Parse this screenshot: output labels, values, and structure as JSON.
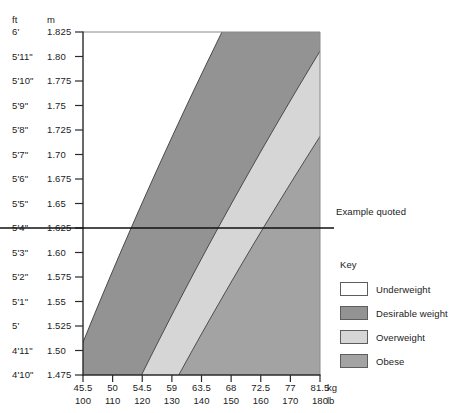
{
  "chart_data": {
    "type": "area",
    "title": "",
    "subtitle": "",
    "xlabel": "",
    "ylabel": "",
    "grid": false,
    "legend_position": "right",
    "y_axis": {
      "unit_primary": "ft",
      "unit_secondary": "m",
      "ticks": [
        {
          "ft": "6'",
          "m": "1.825"
        },
        {
          "ft": "5'11\"",
          "m": "1.80"
        },
        {
          "ft": "5'10\"",
          "m": "1.775"
        },
        {
          "ft": "5'9\"",
          "m": "1.75"
        },
        {
          "ft": "5'8\"",
          "m": "1.725"
        },
        {
          "ft": "5'7\"",
          "m": "1.70"
        },
        {
          "ft": "5'6\"",
          "m": "1.675"
        },
        {
          "ft": "5'5\"",
          "m": "1.65"
        },
        {
          "ft": "5'4\"",
          "m": "1.625"
        },
        {
          "ft": "5'3\"",
          "m": "1.60"
        },
        {
          "ft": "5'2\"",
          "m": "1.575"
        },
        {
          "ft": "5'1\"",
          "m": "1.55"
        },
        {
          "ft": "5'",
          "m": "1.525"
        },
        {
          "ft": "4'11\"",
          "m": "1.50"
        },
        {
          "ft": "4'10\"",
          "m": "1.475"
        }
      ],
      "range_m": [
        1.475,
        1.825
      ]
    },
    "x_axis": {
      "unit_primary": "kg",
      "unit_secondary": "lb",
      "ticks": [
        {
          "kg": "45.5",
          "lb": "100"
        },
        {
          "kg": "50",
          "lb": "110"
        },
        {
          "kg": "54.5",
          "lb": "120"
        },
        {
          "kg": "59",
          "lb": "130"
        },
        {
          "kg": "63.5",
          "lb": "140"
        },
        {
          "kg": "68",
          "lb": "150"
        },
        {
          "kg": "72.5",
          "lb": "160"
        },
        {
          "kg": "77",
          "lb": "170"
        },
        {
          "kg": "81.5",
          "lb": "180"
        }
      ],
      "range_kg": [
        41.0,
        86.0
      ],
      "range_lb": [
        90,
        190
      ]
    },
    "bands": [
      {
        "name": "Underweight",
        "color": "#ffffff",
        "bmi_range": "below 20"
      },
      {
        "name": "Desirable weight",
        "color": "#939393",
        "bmi_range": "20 to 25"
      },
      {
        "name": "Overweight",
        "color": "#d6d6d6",
        "bmi_range": "25 to 30"
      },
      {
        "name": "Obese",
        "color": "#a3a3a3",
        "bmi_range": "over 30"
      }
    ],
    "annotations": [
      {
        "label": "Example quoted",
        "type": "horizontal-line",
        "at_m": "1.625",
        "at_ft": "5'4\""
      }
    ]
  },
  "legend": {
    "title": "Key",
    "items": [
      {
        "label": "Underweight",
        "color": "#ffffff"
      },
      {
        "label": "Desirable weight",
        "color": "#939393"
      },
      {
        "label": "Overweight",
        "color": "#d6d6d6"
      },
      {
        "label": "Obese",
        "color": "#a3a3a3"
      }
    ]
  },
  "annotation": {
    "example_label": "Example quoted"
  },
  "axis_headers": {
    "ft": "ft",
    "m": "m",
    "kg": "kg",
    "lb": "lb"
  }
}
